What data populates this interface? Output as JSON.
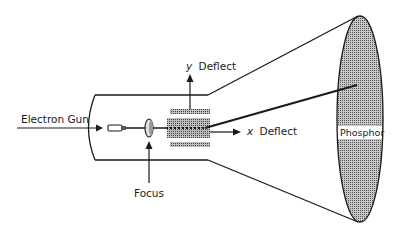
{
  "diagram": {
    "labels": {
      "electron_gun": "Electron Gun",
      "focus": "Focus",
      "y_deflect_axis": "y",
      "y_deflect": "Deflect",
      "x_deflect_axis": "x",
      "x_deflect": "Deflect",
      "phosphor": "Phosphor"
    },
    "colors": {
      "line": "#1a1a1a",
      "phosphor_fill": "#9a9a9a",
      "plate_fill": "#a8a8a8",
      "background": "#ffffff"
    }
  }
}
